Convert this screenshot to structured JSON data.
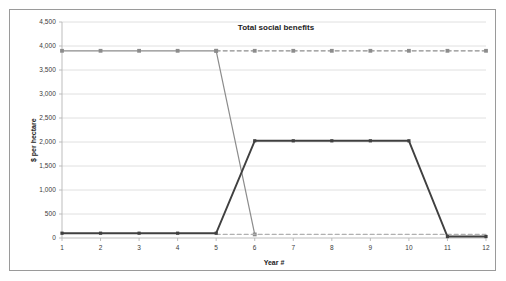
{
  "chart_data": {
    "type": "line",
    "title": "Total social benefits",
    "xlabel": "Year #",
    "ylabel": "$ per hectare",
    "x": [
      1,
      2,
      3,
      4,
      5,
      6,
      7,
      8,
      9,
      10,
      11,
      12
    ],
    "xtick_labels": [
      "1",
      "2",
      "3",
      "4",
      "5",
      "6",
      "7",
      "8",
      "9",
      "10",
      "11",
      "12"
    ],
    "ytick_labels": [
      "0",
      "500",
      "1,000",
      "1,500",
      "2,000",
      "2,500",
      "3,000",
      "3,500",
      "4,000",
      "4,500"
    ],
    "yticks": [
      0,
      500,
      1000,
      1500,
      2000,
      2500,
      3000,
      3500,
      4000,
      4500
    ],
    "ylim": [
      0,
      4500
    ],
    "xlim": [
      1,
      12
    ],
    "grid": true,
    "legend": "none",
    "series": [
      {
        "name": "grey-solid-high",
        "color": "#8c8c8c",
        "style": "solid",
        "marker": "square",
        "x": [
          1,
          2,
          3,
          4,
          5,
          6
        ],
        "values": [
          3900,
          3900,
          3900,
          3900,
          3900,
          75
        ]
      },
      {
        "name": "grey-dashed-high",
        "color": "#8c8c8c",
        "style": "dashed",
        "marker": "square",
        "x": [
          5,
          6,
          7,
          8,
          9,
          10,
          11,
          12
        ],
        "values": [
          3900,
          3900,
          3900,
          3900,
          3900,
          3900,
          3900,
          3900
        ]
      },
      {
        "name": "grey-dashed-low",
        "color": "#b0b0b0",
        "style": "dashed",
        "marker": "none",
        "x": [
          5,
          6,
          7,
          8,
          9,
          10,
          11,
          12
        ],
        "values": [
          75,
          75,
          75,
          75,
          75,
          75,
          75,
          75
        ]
      },
      {
        "name": "dark-solid",
        "color": "#404040",
        "style": "solid",
        "marker": "square",
        "x": [
          1,
          2,
          3,
          4,
          5,
          6,
          7,
          8,
          9,
          10,
          11,
          12
        ],
        "values": [
          100,
          100,
          100,
          100,
          100,
          2025,
          2025,
          2025,
          2025,
          2025,
          30,
          30
        ]
      }
    ],
    "plot_area": {
      "left": 62,
      "top": 22,
      "right": 486,
      "bottom": 238
    },
    "colors": {
      "gridline": "#d8d8d8",
      "axis": "#b5b5b5",
      "frame_border": "#9a9a9a",
      "text": "#3a3a3a",
      "title_text": "#1c1c1c",
      "background": "#ffffff"
    }
  }
}
